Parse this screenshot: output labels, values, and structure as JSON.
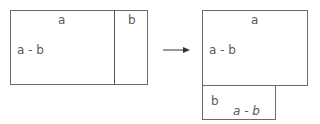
{
  "left_figure": {
    "top_label": "a",
    "right_strip_label": "b",
    "side_label": "a - b"
  },
  "arrow": {
    "direction": "right"
  },
  "right_figure": {
    "top_label": "a",
    "side_label": "a - b",
    "bottom_left_label": "b",
    "bottom_length_label": "a - b"
  }
}
